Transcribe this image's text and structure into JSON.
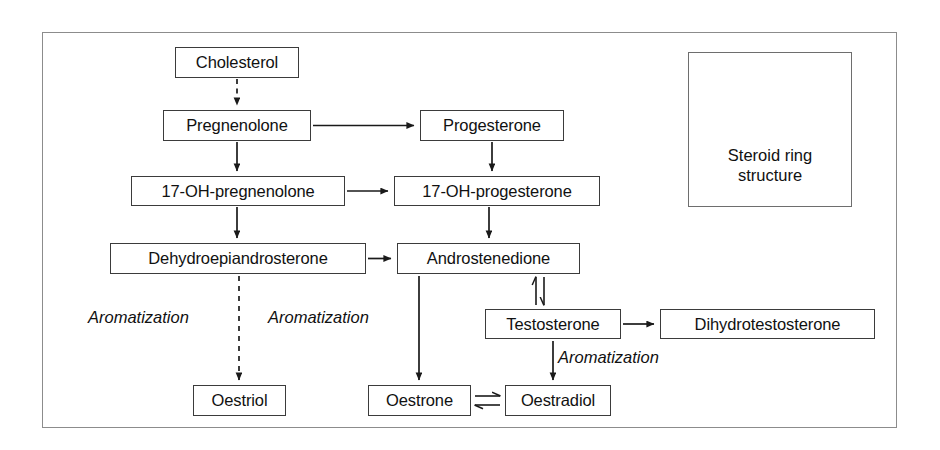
{
  "diagram": {
    "type": "flowchart",
    "frame": {
      "x": 42,
      "y": 32,
      "width": 855,
      "height": 396
    },
    "colors": {
      "frame_border": "#8c8c8c",
      "node_border": "#3b3b3b",
      "arrow": "#1a1a1a",
      "text": "#111111",
      "background": "#ffffff"
    },
    "nodes": [
      {
        "id": "cholesterol",
        "label": "Cholesterol",
        "x": 175,
        "y": 47,
        "width": 124,
        "height": 31
      },
      {
        "id": "pregnenolone",
        "label": "Pregnenolone",
        "x": 163,
        "y": 110,
        "width": 148,
        "height": 31
      },
      {
        "id": "progesterone",
        "label": "Progesterone",
        "x": 420,
        "y": 110,
        "width": 144,
        "height": 31
      },
      {
        "id": "oh17_pregnenolone",
        "label": "17-OH-pregnenolone",
        "x": 131,
        "y": 176,
        "width": 214,
        "height": 30
      },
      {
        "id": "oh17_progesterone",
        "label": "17-OH-progesterone",
        "x": 394,
        "y": 176,
        "width": 206,
        "height": 30
      },
      {
        "id": "dhea",
        "label": "Dehydroepiandrosterone",
        "x": 110,
        "y": 243,
        "width": 256,
        "height": 31
      },
      {
        "id": "androstenedione",
        "label": "Androstenedione",
        "x": 397,
        "y": 243,
        "width": 183,
        "height": 31
      },
      {
        "id": "testosterone",
        "label": "Testosterone",
        "x": 485,
        "y": 309,
        "width": 136,
        "height": 30
      },
      {
        "id": "dihydrotestosterone",
        "label": "Dihydrotestosterone",
        "x": 660,
        "y": 309,
        "width": 215,
        "height": 30
      },
      {
        "id": "oestriol",
        "label": "Oestriol",
        "x": 193,
        "y": 385,
        "width": 93,
        "height": 31
      },
      {
        "id": "oestrone",
        "label": "Oestrone",
        "x": 368,
        "y": 385,
        "width": 103,
        "height": 31
      },
      {
        "id": "oestradiol",
        "label": "Oestradiol",
        "x": 505,
        "y": 385,
        "width": 106,
        "height": 31
      }
    ],
    "edges": [
      {
        "from": "cholesterol",
        "to": "pregnenolone",
        "style": "dashed",
        "direction": "down"
      },
      {
        "from": "pregnenolone",
        "to": "progesterone",
        "style": "solid",
        "direction": "right"
      },
      {
        "from": "pregnenolone",
        "to": "oh17_pregnenolone",
        "style": "solid",
        "direction": "down"
      },
      {
        "from": "progesterone",
        "to": "oh17_progesterone",
        "style": "solid",
        "direction": "down"
      },
      {
        "from": "oh17_pregnenolone",
        "to": "oh17_progesterone",
        "style": "solid",
        "direction": "right"
      },
      {
        "from": "oh17_pregnenolone",
        "to": "dhea",
        "style": "solid",
        "direction": "down"
      },
      {
        "from": "oh17_progesterone",
        "to": "androstenedione",
        "style": "solid",
        "direction": "down"
      },
      {
        "from": "dhea",
        "to": "androstenedione",
        "style": "solid",
        "direction": "right"
      },
      {
        "from": "dhea",
        "to": "oestriol",
        "style": "dashed",
        "direction": "down",
        "label": "Aromatization"
      },
      {
        "from": "androstenedione",
        "to": "oestrone",
        "style": "solid",
        "direction": "down",
        "label": "Aromatization"
      },
      {
        "from": "androstenedione",
        "to": "testosterone",
        "style": "solid",
        "direction": "reversible-vertical"
      },
      {
        "from": "testosterone",
        "to": "dihydrotestosterone",
        "style": "solid",
        "direction": "right"
      },
      {
        "from": "testosterone",
        "to": "oestradiol",
        "style": "solid",
        "direction": "down",
        "label": "Aromatization"
      },
      {
        "from": "oestrone",
        "to": "oestradiol",
        "style": "solid",
        "direction": "reversible-horizontal"
      }
    ],
    "edge_labels": [
      {
        "id": "aromatization-dhea-oestriol",
        "text": "Aromatization",
        "x": 88,
        "y": 309
      },
      {
        "id": "aromatization-androstenedione-oestrone",
        "text": "Aromatization",
        "x": 268,
        "y": 309
      },
      {
        "id": "aromatization-testosterone-oestradiol",
        "text": "Aromatization",
        "x": 558,
        "y": 349
      }
    ],
    "inset_panel": {
      "id": "steroid-ring-panel",
      "x": 688,
      "y": 52,
      "width": 164,
      "height": 155,
      "caption_line1": "Steroid ring",
      "caption_line2": "structure",
      "structure": "cyclopentanoperhydrophenanthrene"
    }
  }
}
